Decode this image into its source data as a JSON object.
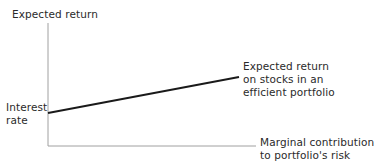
{
  "diagram": {
    "y_axis_label": "Expected return",
    "x_axis_label_line1": "Marginal contribution",
    "x_axis_label_line2": "to portfolio's risk",
    "intercept_label_line1": "Interest",
    "intercept_label_line2": "rate",
    "line_label_line1": "Expected return",
    "line_label_line2": "on stocks in an",
    "line_label_line3": "efficient portfolio",
    "colors": {
      "axis": "#9a9a9a",
      "line": "#1a1a1a",
      "text": "#2a2a2a"
    }
  }
}
